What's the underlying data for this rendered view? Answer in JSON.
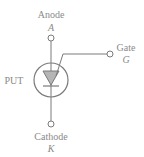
{
  "diagram": {
    "title": "PUT",
    "colors": {
      "stroke": "#7a7a7a",
      "text": "#8a8a8a",
      "triangle_fill": "#b5b5b5",
      "background": "#ffffff"
    },
    "device_label": "PUT",
    "terminals": {
      "anode": {
        "name": "Anode",
        "symbol": "A"
      },
      "gate": {
        "name": "Gate",
        "symbol": "G"
      },
      "cathode": {
        "name": "Cathode",
        "symbol": "K"
      }
    }
  }
}
